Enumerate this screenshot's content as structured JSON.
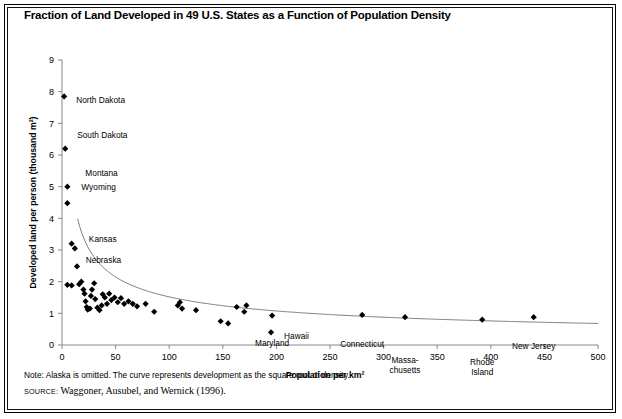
{
  "title": "Fraction of Land Developed in 49 U.S. States as a Function of Population Density",
  "note": "Note: Alaska is omitted. The curve represents development as the square root of density.",
  "source_prefix": "SOURCE:",
  "source_text": "Waggoner, Ausubel, and Wernick (1996).",
  "chart_data": {
    "type": "scatter",
    "title": "Fraction of Land Developed in 49 U.S. States as a Function of Population Density",
    "xlabel": "Population per km²",
    "ylabel": "Developed land per person (thousand m²)",
    "xlim": [
      0,
      500
    ],
    "ylim": [
      0,
      9
    ],
    "xticks": [
      0,
      50,
      100,
      150,
      200,
      250,
      300,
      350,
      400,
      450,
      500
    ],
    "yticks": [
      0,
      1,
      2,
      3,
      4,
      5,
      6,
      7,
      8,
      9
    ],
    "grid": false,
    "legend": "none",
    "marker": "filled-diamond",
    "marker_color": "#000000",
    "curve_color": "#808080",
    "curve_note": "development as the square root of density",
    "points": [
      {
        "x": 2,
        "y": 7.85,
        "label": "North Dakota",
        "lx": 12,
        "ly": 0.1
      },
      {
        "x": 3,
        "y": 6.2,
        "label": "South Dakota",
        "lx": 12,
        "ly": -0.42
      },
      {
        "x": 5,
        "y": 5.0,
        "label": "Montana",
        "lx": 18,
        "ly": -0.42
      },
      {
        "x": 5,
        "y": 4.48,
        "label": "Wyoming",
        "lx": 14,
        "ly": -0.5
      },
      {
        "x": 9,
        "y": 3.2,
        "label": "Nebraska",
        "lx": 14,
        "ly": 0.52
      },
      {
        "x": 12,
        "y": 3.05,
        "label": "Kansas",
        "lx": 14,
        "ly": -0.3
      },
      {
        "x": 195,
        "y": 0.4,
        "label": "Hawaii",
        "lx": 13,
        "ly": 0.12
      },
      {
        "x": 196,
        "y": 0.93,
        "label": "Maryland",
        "lx": 0,
        "ly": 0.88
      },
      {
        "x": 280,
        "y": 0.95,
        "label": "Connecticut",
        "lx": 0,
        "ly": 0.92
      },
      {
        "x": 320,
        "y": 0.88,
        "label": "Massa-chusetts",
        "lx": 0,
        "ly": 1.35
      },
      {
        "x": 392,
        "y": 0.8,
        "label": "Rhode Island",
        "lx": 0,
        "ly": 1.35
      },
      {
        "x": 440,
        "y": 0.88,
        "label": "New Jersey",
        "lx": 0,
        "ly": 0.9
      },
      {
        "x": 14,
        "y": 2.48,
        "label": "",
        "lx": 0,
        "ly": 0
      },
      {
        "x": 16,
        "y": 1.92,
        "label": "",
        "lx": 0,
        "ly": 0
      },
      {
        "x": 5,
        "y": 1.9,
        "label": "",
        "lx": 0,
        "ly": 0
      },
      {
        "x": 9,
        "y": 1.88,
        "label": "",
        "lx": 0,
        "ly": 0
      },
      {
        "x": 18,
        "y": 2.0,
        "label": "",
        "lx": 0,
        "ly": 0
      },
      {
        "x": 20,
        "y": 1.75,
        "label": "",
        "lx": 0,
        "ly": 0
      },
      {
        "x": 21,
        "y": 1.62,
        "label": "",
        "lx": 0,
        "ly": 0
      },
      {
        "x": 22,
        "y": 1.38,
        "label": "",
        "lx": 0,
        "ly": 0
      },
      {
        "x": 23,
        "y": 1.2,
        "label": "",
        "lx": 0,
        "ly": 0
      },
      {
        "x": 24,
        "y": 1.12,
        "label": "",
        "lx": 0,
        "ly": 0
      },
      {
        "x": 26,
        "y": 1.15,
        "label": "",
        "lx": 0,
        "ly": 0
      },
      {
        "x": 27,
        "y": 1.55,
        "label": "",
        "lx": 0,
        "ly": 0
      },
      {
        "x": 28,
        "y": 1.75,
        "label": "",
        "lx": 0,
        "ly": 0
      },
      {
        "x": 30,
        "y": 1.95,
        "label": "",
        "lx": 0,
        "ly": 0
      },
      {
        "x": 31,
        "y": 1.45,
        "label": "",
        "lx": 0,
        "ly": 0
      },
      {
        "x": 33,
        "y": 1.18,
        "label": "",
        "lx": 0,
        "ly": 0
      },
      {
        "x": 35,
        "y": 1.1,
        "label": "",
        "lx": 0,
        "ly": 0
      },
      {
        "x": 37,
        "y": 1.25,
        "label": "",
        "lx": 0,
        "ly": 0
      },
      {
        "x": 38,
        "y": 1.6,
        "label": "",
        "lx": 0,
        "ly": 0
      },
      {
        "x": 40,
        "y": 1.5,
        "label": "",
        "lx": 0,
        "ly": 0
      },
      {
        "x": 42,
        "y": 1.3,
        "label": "",
        "lx": 0,
        "ly": 0
      },
      {
        "x": 44,
        "y": 1.62,
        "label": "",
        "lx": 0,
        "ly": 0
      },
      {
        "x": 46,
        "y": 1.42,
        "label": "",
        "lx": 0,
        "ly": 0
      },
      {
        "x": 49,
        "y": 1.5,
        "label": "",
        "lx": 0,
        "ly": 0
      },
      {
        "x": 52,
        "y": 1.35,
        "label": "",
        "lx": 0,
        "ly": 0
      },
      {
        "x": 55,
        "y": 1.48,
        "label": "",
        "lx": 0,
        "ly": 0
      },
      {
        "x": 58,
        "y": 1.3,
        "label": "",
        "lx": 0,
        "ly": 0
      },
      {
        "x": 62,
        "y": 1.38,
        "label": "",
        "lx": 0,
        "ly": 0
      },
      {
        "x": 66,
        "y": 1.3,
        "label": "",
        "lx": 0,
        "ly": 0
      },
      {
        "x": 70,
        "y": 1.22,
        "label": "",
        "lx": 0,
        "ly": 0
      },
      {
        "x": 78,
        "y": 1.3,
        "label": "",
        "lx": 0,
        "ly": 0
      },
      {
        "x": 86,
        "y": 1.05,
        "label": "",
        "lx": 0,
        "ly": 0
      },
      {
        "x": 108,
        "y": 1.25,
        "label": "",
        "lx": 0,
        "ly": 0
      },
      {
        "x": 110,
        "y": 1.35,
        "label": "",
        "lx": 0,
        "ly": 0
      },
      {
        "x": 112,
        "y": 1.15,
        "label": "",
        "lx": 0,
        "ly": 0
      },
      {
        "x": 125,
        "y": 1.1,
        "label": "",
        "lx": 0,
        "ly": 0
      },
      {
        "x": 148,
        "y": 0.75,
        "label": "",
        "lx": 0,
        "ly": 0
      },
      {
        "x": 155,
        "y": 0.68,
        "label": "",
        "lx": 0,
        "ly": 0
      },
      {
        "x": 163,
        "y": 1.2,
        "label": "",
        "lx": 0,
        "ly": 0
      },
      {
        "x": 170,
        "y": 1.05,
        "label": "",
        "lx": 0,
        "ly": 0
      },
      {
        "x": 172,
        "y": 1.25,
        "label": "",
        "lx": 0,
        "ly": 0
      }
    ]
  }
}
